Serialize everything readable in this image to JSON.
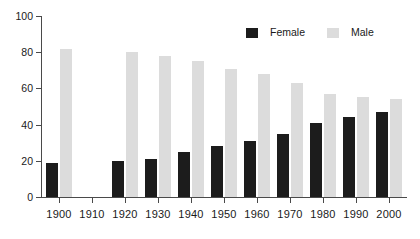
{
  "chart_data": {
    "type": "bar",
    "title": "",
    "subtitle": "",
    "xlabel": "",
    "ylabel": "",
    "ylim": [
      0,
      100
    ],
    "yticks": [
      0,
      20,
      40,
      60,
      80,
      100
    ],
    "grid": false,
    "legend_position": "top-right",
    "categories": [
      "1900",
      "1910",
      "1920",
      "1930",
      "1940",
      "1950",
      "1960",
      "1970",
      "1980",
      "1990",
      "2000"
    ],
    "series": [
      {
        "name": "Female",
        "color": "#1c1c1c",
        "values": [
          19,
          null,
          20,
          21,
          25,
          28,
          31,
          35,
          41,
          44,
          47
        ]
      },
      {
        "name": "Male",
        "color": "#dcdcdc",
        "values": [
          82,
          null,
          80,
          78,
          75,
          71,
          68,
          63,
          57,
          55,
          54
        ]
      }
    ]
  },
  "legend": {
    "items": [
      {
        "label": "Female",
        "swatch": "female"
      },
      {
        "label": "Male",
        "swatch": "male"
      }
    ]
  },
  "axis": {
    "y_tick_labels": [
      "0",
      "20",
      "40",
      "60",
      "80",
      "100"
    ],
    "x_tick_labels": [
      "1900",
      "1910",
      "1920",
      "1930",
      "1940",
      "1950",
      "1960",
      "1970",
      "1980",
      "1990",
      "2000"
    ]
  },
  "colors": {
    "female": "#1c1c1c",
    "male": "#dcdcdc",
    "axis": "#4a4a4a",
    "text": "#1a1a1a",
    "background": "#ffffff"
  }
}
